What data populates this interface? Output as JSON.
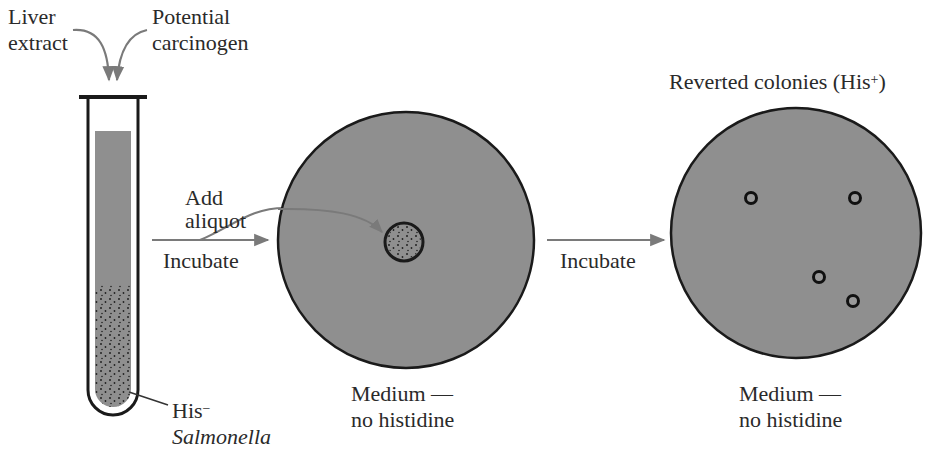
{
  "labels": {
    "liver_extract_1": "Liver",
    "liver_extract_2": "extract",
    "carcinogen_1": "Potential",
    "carcinogen_2": "carcinogen",
    "add_aliquot_1": "Add",
    "add_aliquot_2": "aliquot",
    "incubate_1": "Incubate",
    "incubate_2": "Incubate",
    "his_minus": "His",
    "his_minus_sup": "−",
    "salmonella": "Salmonella",
    "medium_1a": "Medium —",
    "medium_1b": "no histidine",
    "medium_2a": "Medium —",
    "medium_2b": "no histidine",
    "reverted": "Reverted colonies (His",
    "reverted_sup": "+",
    "reverted_close": ")"
  },
  "colors": {
    "medium_gray": "#8f8f8f",
    "outline": "#1a1a1a",
    "arrow": "#7a7a7a"
  },
  "diagram": {
    "steps": [
      {
        "id": "test-tube",
        "contents": [
          "Liver extract",
          "Potential carcinogen",
          "His− Salmonella"
        ]
      },
      {
        "id": "plate-1",
        "note": "aliquot spot at center",
        "medium": "no histidine"
      },
      {
        "id": "plate-2",
        "colonies": 4,
        "medium": "no histidine"
      }
    ],
    "transitions": [
      "Add aliquot / Incubate",
      "Incubate"
    ]
  }
}
